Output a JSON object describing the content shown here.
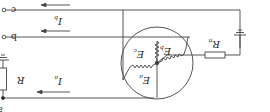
{
  "diagram": {
    "orientation": "rotated-180",
    "colors": {
      "stroke": "#444444",
      "background": "#ffffff"
    },
    "terminals": [
      {
        "id": "c",
        "label": "c"
      },
      {
        "id": "b",
        "label": "b"
      },
      {
        "id": "a",
        "label": "a"
      }
    ],
    "currents": [
      {
        "id": "ic",
        "main": "I",
        "sub": "c"
      },
      {
        "id": "ib",
        "main": "I",
        "sub": "b"
      },
      {
        "id": "ia",
        "main": "I",
        "sub": "a"
      }
    ],
    "emfs": [
      {
        "id": "ec",
        "main": "E",
        "sub": "c"
      },
      {
        "id": "eb",
        "main": "E",
        "sub": "b"
      },
      {
        "id": "ea",
        "main": "E",
        "sub": "a"
      }
    ],
    "resistors": [
      {
        "id": "r",
        "main": "R",
        "sub": ""
      },
      {
        "id": "rn",
        "main": "R",
        "sub": "n"
      }
    ]
  }
}
